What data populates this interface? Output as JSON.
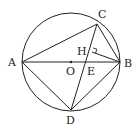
{
  "diagram": {
    "type": "geometry-circle-inscribed-quadrilateral",
    "circle": {
      "center": "O",
      "cx": 71,
      "cy": 62,
      "r": 49
    },
    "points": [
      {
        "label": "A",
        "x": 22,
        "y": 62,
        "lx": 8,
        "ly": 66
      },
      {
        "label": "B",
        "x": 120,
        "y": 62,
        "lx": 124,
        "ly": 67
      },
      {
        "label": "C",
        "x": 97,
        "y": 24,
        "lx": 98,
        "ly": 18
      },
      {
        "label": "D",
        "x": 71,
        "y": 110,
        "lx": 66,
        "ly": 124
      },
      {
        "label": "O",
        "x": 71,
        "y": 62,
        "lx": 66,
        "ly": 75
      },
      {
        "label": "E",
        "x": 87,
        "y": 62,
        "lx": 87,
        "ly": 75
      },
      {
        "label": "H",
        "x": 92,
        "y": 52,
        "lx": 77,
        "ly": 55
      }
    ],
    "segments": [
      "AB",
      "AC",
      "BC",
      "AD",
      "BD",
      "CD",
      "BH"
    ],
    "right_angle": "CHB",
    "labels": {
      "A": "A",
      "B": "B",
      "C": "C",
      "D": "D",
      "O": "O",
      "E": "E",
      "H": "H"
    }
  }
}
